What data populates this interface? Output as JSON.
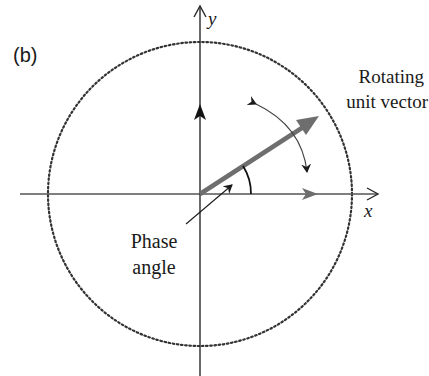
{
  "figure": {
    "panel_label": "(b)",
    "axes": {
      "x_label": "x",
      "y_label": "y"
    },
    "annotations": {
      "rotating_vector_line1": "Rotating",
      "rotating_vector_line2": "unit vector",
      "phase_angle_line1": "Phase",
      "phase_angle_line2": "angle"
    },
    "colors": {
      "axis": "#2a2a2a",
      "vector": "#6e6e6e",
      "circle": "#333333",
      "background": "#ffffff"
    },
    "geometry": {
      "origin": [
        200,
        194
      ],
      "circle_radius": 152,
      "vector_angle_deg": 33
    }
  }
}
